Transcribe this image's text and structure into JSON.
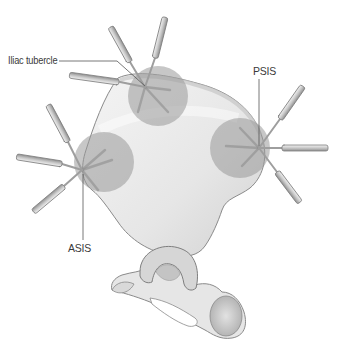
{
  "figure": {
    "colors": {
      "bone": "#eeeeee",
      "bone_shadow": "#bdbdbd",
      "bone_outline": "#8a8a8a",
      "site_overlay": "#9a9a9a",
      "needle": "#c9c9c9",
      "needle_outline": "#7d7d7d",
      "label_text": "#3a3a3a",
      "leader_line": "#555555"
    },
    "labels": {
      "iliac_tubercle": "Iliac tubercle",
      "psis": "PSIS",
      "asis": "ASIS"
    },
    "sites": [
      {
        "name": "Iliac tubercle",
        "needle_count": 5
      },
      {
        "name": "PSIS",
        "needle_count": 5
      },
      {
        "name": "ASIS",
        "needle_count": 5
      }
    ]
  }
}
